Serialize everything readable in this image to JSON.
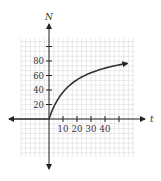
{
  "chart_data": {
    "type": "line",
    "title": "",
    "xlabel": "t",
    "ylabel": "N",
    "x_ticks": [
      10,
      20,
      30,
      40
    ],
    "x_tick_marks": [
      10,
      20,
      30,
      40,
      50
    ],
    "y_ticks": [
      20,
      40,
      60,
      80
    ],
    "y_tick_marks": [
      20,
      40,
      60,
      80,
      100
    ],
    "xlim": [
      -30,
      57
    ],
    "ylim": [
      -50,
      110
    ],
    "grid": true,
    "legend": null,
    "series": [
      {
        "name": "N(t)",
        "x": [
          0,
          2,
          5,
          10,
          15,
          20,
          25,
          30,
          35,
          40,
          45,
          50,
          56
        ],
        "values": [
          0,
          11,
          23,
          37,
          47,
          54,
          60,
          64,
          67,
          70,
          73,
          75,
          77
        ],
        "arrow_end": true
      }
    ]
  },
  "labels": {
    "y_axis": "N",
    "x_axis": "t",
    "x_tick_labels": [
      "10",
      "20",
      "30",
      "40"
    ],
    "y_tick_labels": [
      "20",
      "40",
      "60",
      "80"
    ]
  },
  "colors": {
    "grid": "#d4d4d4",
    "axis": "#222222",
    "curve": "#333333"
  }
}
